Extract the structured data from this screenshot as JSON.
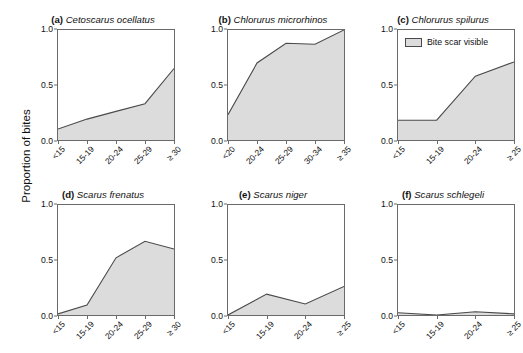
{
  "figure": {
    "ylabel": "Proportion of bites",
    "legend_label": "Bite scar visible",
    "fill_color": "#dcdcdc",
    "line_color": "#4a4a4a",
    "axis_color": "#6a6a6a",
    "y_ticks": [
      "0.0",
      "0.5",
      "1.0"
    ]
  },
  "chart_data": [
    {
      "type": "area",
      "panel": "(a)",
      "title": "Cetoscarus ocellatus",
      "categories": [
        "<15",
        "15-19",
        "20-24",
        "25-29",
        "≥ 30"
      ],
      "values": [
        0.1,
        0.19,
        0.26,
        0.33,
        0.65
      ],
      "xlabel": "",
      "ylabel": "Proportion of bites",
      "ylim": [
        0,
        1
      ],
      "yticks": [
        0.0,
        0.5,
        1.0
      ],
      "grid": false,
      "series_name": "Bite scar visible"
    },
    {
      "type": "area",
      "panel": "(b)",
      "title": "Chlorurus microrhinos",
      "categories": [
        "<20",
        "20-24",
        "25-29",
        "30-34",
        "≥ 35"
      ],
      "values": [
        0.23,
        0.7,
        0.88,
        0.87,
        1.0
      ],
      "xlabel": "",
      "ylabel": "Proportion of bites",
      "ylim": [
        0,
        1
      ],
      "yticks": [
        0.0,
        0.5,
        1.0
      ],
      "grid": false,
      "series_name": "Bite scar visible"
    },
    {
      "type": "area",
      "panel": "(c)",
      "title": "Chlorurus spilurus",
      "categories": [
        "<15",
        "15-19",
        "20-24",
        "≥ 25"
      ],
      "values": [
        0.18,
        0.18,
        0.58,
        0.71
      ],
      "xlabel": "",
      "ylabel": "Proportion of bites",
      "ylim": [
        0,
        1
      ],
      "yticks": [
        0.0,
        0.5,
        1.0
      ],
      "grid": false,
      "legend": "Bite scar visible",
      "legend_position": "top-left",
      "series_name": "Bite scar visible"
    },
    {
      "type": "area",
      "panel": "(d)",
      "title": "Scarus frenatus",
      "categories": [
        "<15",
        "15-19",
        "20-24",
        "25-29",
        "≥ 30"
      ],
      "values": [
        0.01,
        0.09,
        0.52,
        0.67,
        0.6
      ],
      "xlabel": "",
      "ylabel": "Proportion of bites",
      "ylim": [
        0,
        1
      ],
      "yticks": [
        0.0,
        0.5,
        1.0
      ],
      "grid": false,
      "series_name": "Bite scar visible"
    },
    {
      "type": "area",
      "panel": "(e)",
      "title": "Scarus niger",
      "categories": [
        "<15",
        "15-19",
        "20-24",
        "≥ 25"
      ],
      "values": [
        0.0,
        0.19,
        0.1,
        0.26
      ],
      "xlabel": "",
      "ylabel": "Proportion of bites",
      "ylim": [
        0,
        1
      ],
      "yticks": [
        0.0,
        0.5,
        1.0
      ],
      "grid": false,
      "series_name": "Bite scar visible"
    },
    {
      "type": "area",
      "panel": "(f)",
      "title": "Scarus schlegeli",
      "categories": [
        "<15",
        "15-19",
        "20-24",
        "≥ 25"
      ],
      "values": [
        0.02,
        0.0,
        0.03,
        0.01
      ],
      "xlabel": "",
      "ylabel": "Proportion of bites",
      "ylim": [
        0,
        1
      ],
      "yticks": [
        0.0,
        0.5,
        1.0
      ],
      "grid": false,
      "series_name": "Bite scar visible"
    }
  ]
}
